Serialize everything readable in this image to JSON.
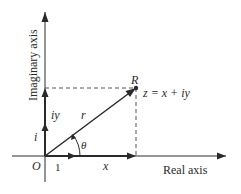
{
  "diagram": {
    "type": "argand-diagram",
    "colors": {
      "stroke": "#2a2a2a",
      "dashed": "#555555",
      "background": "#ffffff"
    },
    "axes": {
      "x_label": "Real axis",
      "y_label": "Imaginary axis"
    },
    "origin_label": "O",
    "unit_real_label": "1",
    "unit_imag_label": "i",
    "point_label": "R",
    "point_equation": "z = x + iy",
    "vector_label": "r",
    "angle_label": "θ",
    "real_component_label": "x",
    "imag_component_label": "iy"
  }
}
